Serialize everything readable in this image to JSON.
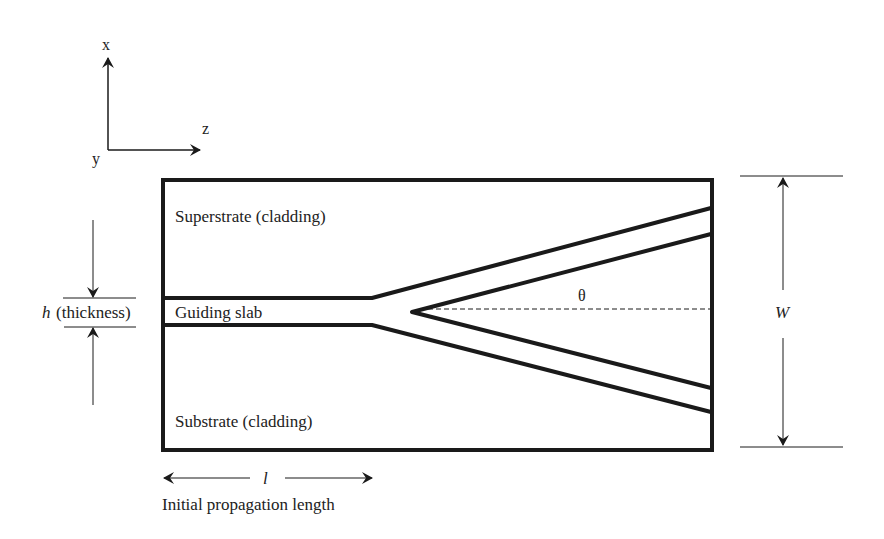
{
  "axes": {
    "x_label": "x",
    "y_label": "y",
    "z_label": "z"
  },
  "regions": {
    "superstrate": "Superstrate (cladding)",
    "guiding_slab": "Guiding slab",
    "substrate": "Substrate (cladding)"
  },
  "dimensions": {
    "thickness_symbol": "h",
    "thickness_label": "(thickness)",
    "width_symbol": "W",
    "angle_symbol": "θ",
    "length_symbol": "l",
    "length_label": "Initial propagation length"
  },
  "colors": {
    "stroke": "#1a1a1a",
    "background": "#ffffff"
  }
}
